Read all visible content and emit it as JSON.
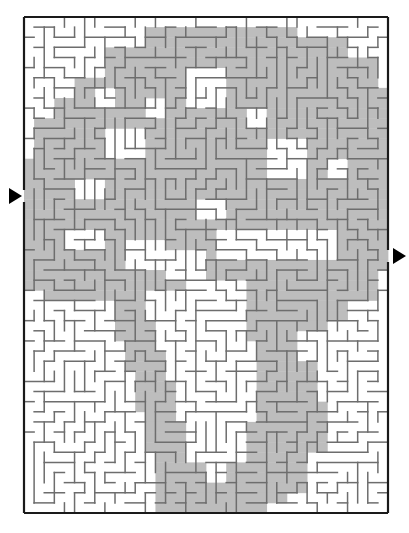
{
  "puzzle": {
    "kind": "maze-puzzle",
    "title": "",
    "background_color": "#ffffff"
  },
  "maze": {
    "frame": {
      "x": 24,
      "y": 17,
      "width": 364,
      "height": 496
    },
    "grid": {
      "cols": 36,
      "rows": 49,
      "cell": 10.11
    },
    "colors": {
      "border": "#1a1a1a",
      "wall": "#6d6d6d",
      "shade": "#bdbdbd",
      "shade_edge": "#9a9a9a",
      "page": "#ffffff",
      "arrow": "#000000"
    },
    "border_width": 2.2,
    "wall_width": 1.5
  },
  "entrance": {
    "label": "entrance",
    "side": "left",
    "arrow_tip_x": 24,
    "arrow_y": 196,
    "arrow_size": 13,
    "gap_y_from": 190,
    "gap_y_to": 202
  },
  "exit": {
    "label": "exit",
    "side": "right",
    "arrow_tip_x": 388,
    "arrow_y": 256,
    "arrow_size": 13,
    "gap_y_from": 250,
    "gap_y_to": 262
  },
  "solution_region": {
    "note": "grey shaded solution corridor, described as axis-aligned rectangles in grid cell units (col,row,w,h); origin top-left of frame",
    "rects": [
      [
        0,
        17,
        4,
        9
      ],
      [
        0,
        19,
        9,
        8
      ],
      [
        2,
        15,
        6,
        6
      ],
      [
        4,
        11,
        5,
        7
      ],
      [
        6,
        8,
        5,
        6
      ],
      [
        8,
        5,
        6,
        5
      ],
      [
        11,
        3,
        8,
        4
      ],
      [
        14,
        2,
        10,
        4
      ],
      [
        19,
        3,
        8,
        4
      ],
      [
        22,
        4,
        8,
        5
      ],
      [
        25,
        5,
        8,
        5
      ],
      [
        28,
        7,
        7,
        6
      ],
      [
        30,
        9,
        6,
        8
      ],
      [
        31,
        12,
        5,
        10
      ],
      [
        30,
        18,
        6,
        6
      ],
      [
        26,
        20,
        10,
        5
      ],
      [
        20,
        17,
        10,
        6
      ],
      [
        14,
        16,
        9,
        5
      ],
      [
        9,
        14,
        10,
        6
      ],
      [
        6,
        14,
        7,
        6
      ],
      [
        3,
        12,
        8,
        6
      ],
      [
        2,
        20,
        9,
        4
      ],
      [
        4,
        22,
        8,
        4
      ],
      [
        6,
        24,
        6,
        4
      ],
      [
        9,
        24,
        7,
        3
      ],
      [
        11,
        22,
        8,
        4
      ],
      [
        13,
        20,
        9,
        4
      ],
      [
        16,
        22,
        8,
        4
      ],
      [
        18,
        20,
        8,
        5
      ],
      [
        21,
        22,
        7,
        4
      ],
      [
        23,
        20,
        8,
        4
      ],
      [
        26,
        24,
        6,
        4
      ],
      [
        28,
        22,
        6,
        5
      ],
      [
        30,
        24,
        5,
        4
      ],
      [
        9,
        26,
        3,
        6
      ],
      [
        10,
        30,
        3,
        5
      ],
      [
        11,
        33,
        3,
        6
      ],
      [
        12,
        36,
        3,
        7
      ],
      [
        13,
        40,
        3,
        6
      ],
      [
        13,
        44,
        5,
        5
      ],
      [
        16,
        46,
        8,
        3
      ],
      [
        20,
        44,
        6,
        4
      ],
      [
        22,
        40,
        4,
        6
      ],
      [
        23,
        36,
        4,
        6
      ],
      [
        23,
        30,
        4,
        8
      ],
      [
        22,
        26,
        5,
        6
      ],
      [
        25,
        34,
        4,
        6
      ],
      [
        26,
        38,
        4,
        5
      ],
      [
        24,
        42,
        4,
        5
      ],
      [
        5,
        6,
        5,
        5
      ],
      [
        8,
        3,
        6,
        4
      ],
      [
        12,
        1,
        8,
        3
      ],
      [
        18,
        1,
        9,
        3
      ],
      [
        24,
        2,
        8,
        4
      ],
      [
        29,
        4,
        6,
        5
      ],
      [
        32,
        7,
        4,
        8
      ],
      [
        33,
        13,
        3,
        8
      ],
      [
        0,
        14,
        5,
        6
      ],
      [
        1,
        10,
        5,
        6
      ],
      [
        3,
        8,
        5,
        6
      ],
      [
        16,
        12,
        10,
        6
      ],
      [
        10,
        9,
        8,
        6
      ],
      [
        13,
        6,
        9,
        6
      ],
      [
        19,
        8,
        9,
        6
      ],
      [
        24,
        10,
        8,
        6
      ],
      [
        27,
        14,
        8,
        6
      ],
      [
        20,
        12,
        8,
        6
      ],
      [
        6,
        18,
        8,
        5
      ],
      [
        2,
        24,
        6,
        4
      ],
      [
        25,
        26,
        5,
        5
      ],
      [
        28,
        26,
        4,
        4
      ]
    ],
    "holes": [
      [
        16,
        5,
        4,
        4
      ],
      [
        12,
        8,
        2,
        2
      ],
      [
        7,
        7,
        2,
        2
      ],
      [
        8,
        11,
        4,
        3
      ],
      [
        22,
        9,
        2,
        2
      ],
      [
        24,
        12,
        4,
        4
      ],
      [
        30,
        14,
        2,
        2
      ],
      [
        19,
        21,
        5,
        3
      ],
      [
        23,
        21,
        4,
        3
      ],
      [
        27,
        21,
        4,
        3
      ],
      [
        10,
        22,
        4,
        3
      ],
      [
        4,
        21,
        4,
        2
      ],
      [
        14,
        23,
        4,
        3
      ],
      [
        17,
        18,
        3,
        2
      ],
      [
        5,
        16,
        3,
        2
      ]
    ]
  },
  "walls": {
    "seed": 20250317,
    "description": "orthogonal maze wall segments auto-generated on the 36x49 grid"
  }
}
